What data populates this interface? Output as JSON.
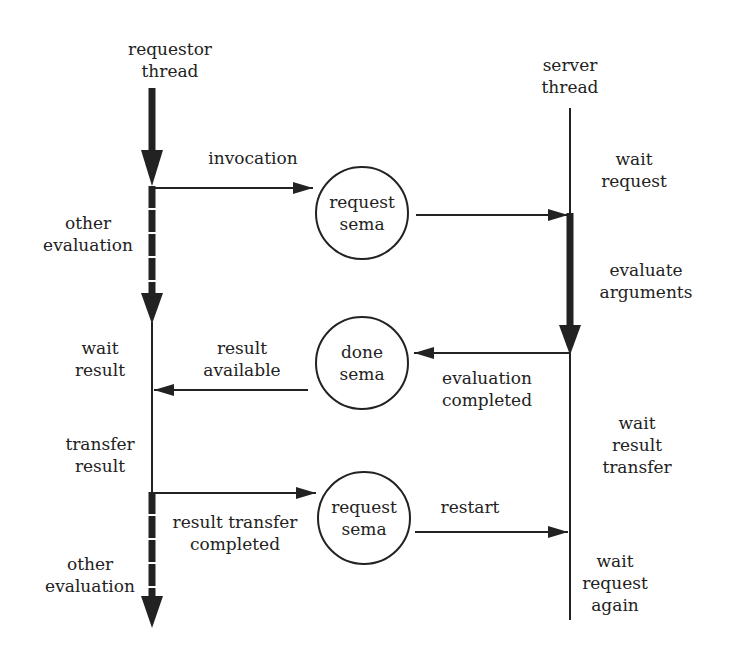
{
  "colors": {
    "ink": "#222222",
    "background": "#ffffff"
  },
  "threads": {
    "requestor": {
      "title": "requestor\nthread"
    },
    "server": {
      "title": "server\nthread"
    }
  },
  "semaphores": [
    {
      "id": "request-sema-1",
      "label": "request\nsema"
    },
    {
      "id": "done-sema",
      "label": "done\nsema"
    },
    {
      "id": "request-sema-2",
      "label": "request\nsema"
    }
  ],
  "requestor_states": [
    {
      "label": "other\nevaluation"
    },
    {
      "label": "wait\nresult"
    },
    {
      "label": "transfer\nresult"
    },
    {
      "label": "other\nevaluation"
    }
  ],
  "server_states": [
    {
      "label": "wait\nrequest"
    },
    {
      "label": "evaluate\narguments"
    },
    {
      "label": "wait\nresult\ntransfer"
    },
    {
      "label": "wait\nrequest\nagain"
    }
  ],
  "messages": [
    {
      "label": "invocation",
      "from": "requestor",
      "to": "request-sema-1"
    },
    {
      "label": "",
      "from": "request-sema-1",
      "to": "server"
    },
    {
      "label": "evaluation\ncompleted",
      "from": "server",
      "to": "done-sema"
    },
    {
      "label": "result\navailable",
      "from": "done-sema",
      "to": "requestor"
    },
    {
      "label": "result transfer\ncompleted",
      "from": "requestor",
      "to": "request-sema-2"
    },
    {
      "label": "restart",
      "from": "request-sema-2",
      "to": "server"
    }
  ]
}
